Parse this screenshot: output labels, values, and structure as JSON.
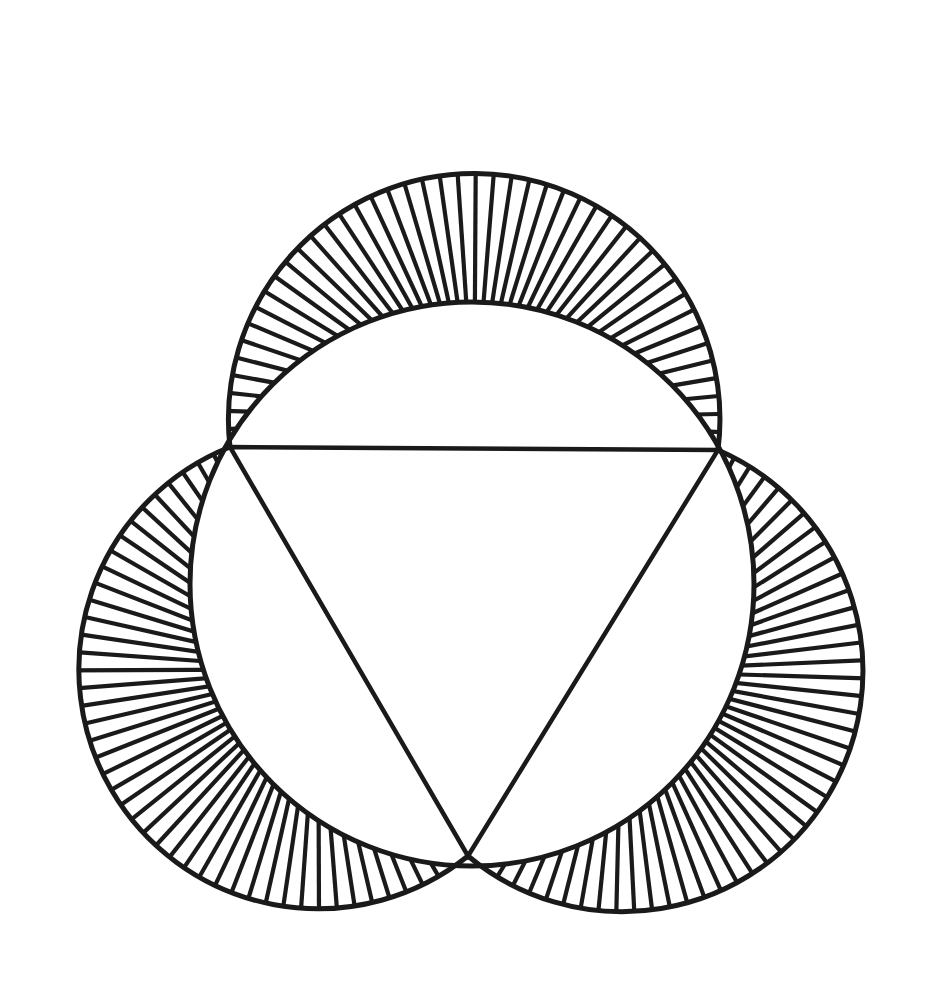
{
  "figure": {
    "stroke_color": "#1a1a1a",
    "background": "#ffffff",
    "triangle": {
      "vertices": [
        [
          230,
          447
        ],
        [
          718,
          450
        ],
        [
          468,
          856
        ]
      ]
    },
    "circumcircle": {
      "cx": 472,
      "cy": 584,
      "r": 282
    },
    "lunes": [
      {
        "name": "top",
        "hatch_count": 46
      },
      {
        "name": "right",
        "hatch_count": 46
      },
      {
        "name": "left",
        "hatch_count": 46
      }
    ],
    "lune_bulge": 275
  }
}
